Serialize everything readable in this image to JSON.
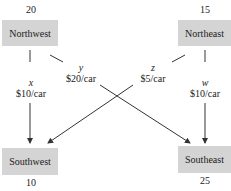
{
  "nodes": {
    "northwest": {
      "label": "Northwest",
      "value": "20"
    },
    "northeast": {
      "label": "Northeast",
      "value": "15"
    },
    "southwest": {
      "label": "Southwest",
      "value": "10"
    },
    "southeast": {
      "label": "Southeast",
      "value": "25"
    }
  },
  "edges": {
    "x": {
      "var": "x",
      "cost": "$10/car",
      "from": "Northwest",
      "to": "Southwest"
    },
    "y": {
      "var": "y",
      "cost": "$20/car",
      "from": "Northwest",
      "to": "Southeast"
    },
    "z": {
      "var": "z",
      "cost": "$5/car",
      "from": "Northeast",
      "to": "Southwest"
    },
    "w": {
      "var": "w",
      "cost": "$10/car",
      "from": "Northeast",
      "to": "Southeast"
    }
  },
  "colors": {
    "node_fill": "#d4d4d4",
    "line": "#333333"
  }
}
